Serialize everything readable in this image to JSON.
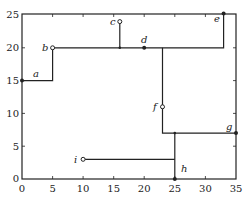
{
  "diagram": {
    "type": "tree-path-plot",
    "xlim": [
      0,
      35
    ],
    "ylim": [
      0,
      25
    ],
    "x_ticks": [
      "0",
      "5",
      "10",
      "15",
      "20",
      "25",
      "30",
      "35"
    ],
    "y_ticks": [
      "0",
      "5",
      "10",
      "15",
      "20",
      "25"
    ],
    "x_origin_label": "0",
    "y_origin_label": "0",
    "points": [
      {
        "label": "a",
        "x": 0,
        "y": 15,
        "style": "filled"
      },
      {
        "label": "b",
        "x": 5,
        "y": 20,
        "style": "hollow"
      },
      {
        "label": "c",
        "x": 16,
        "y": 24,
        "style": "hollow"
      },
      {
        "label": "d",
        "x": 20,
        "y": 20,
        "style": "filled"
      },
      {
        "label": "e",
        "x": 33,
        "y": 25.2,
        "style": "filled"
      },
      {
        "label": "f",
        "x": 23,
        "y": 11,
        "style": "hollow"
      },
      {
        "label": "g",
        "x": 35,
        "y": 7,
        "style": "filled"
      },
      {
        "label": "h",
        "x": 25,
        "y": 0,
        "style": "filled"
      },
      {
        "label": "i",
        "x": 10,
        "y": 3,
        "style": "hollow"
      }
    ],
    "segments": [
      [
        [
          0,
          15
        ],
        [
          5,
          15
        ],
        [
          5,
          20
        ],
        [
          33,
          20
        ],
        [
          33,
          25.2
        ]
      ],
      [
        [
          16,
          24
        ],
        [
          16,
          20
        ]
      ],
      [
        [
          23,
          20
        ],
        [
          23,
          7
        ],
        [
          35,
          7
        ]
      ],
      [
        [
          25,
          7
        ],
        [
          25,
          0
        ]
      ],
      [
        [
          10,
          3
        ],
        [
          25,
          3
        ]
      ]
    ],
    "colors": {
      "line": "#222222",
      "frame": "#222222",
      "background": "#ffffff"
    }
  }
}
